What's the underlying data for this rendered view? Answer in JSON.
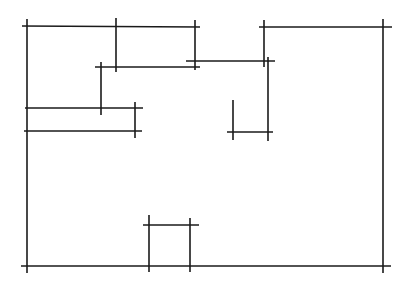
{
  "diagram": {
    "type": "floor-plan-sketch",
    "width": 407,
    "height": 295,
    "stroke_color": "#1a1a1a",
    "background": "#ffffff",
    "segments": [
      {
        "name": "outer-top-left-wall",
        "x1": 22,
        "y1": 26,
        "x2": 200,
        "y2": 27
      },
      {
        "name": "outer-left-wall",
        "x1": 27,
        "y1": 19,
        "x2": 27,
        "y2": 273
      },
      {
        "name": "outer-top-right-wall",
        "x1": 259,
        "y1": 27,
        "x2": 392,
        "y2": 27
      },
      {
        "name": "outer-right-wall",
        "x1": 383,
        "y1": 19,
        "x2": 383,
        "y2": 273
      },
      {
        "name": "outer-bottom-wall",
        "x1": 21,
        "y1": 266,
        "x2": 391,
        "y2": 266
      },
      {
        "name": "inner-vertical-a",
        "x1": 116,
        "y1": 18,
        "x2": 116,
        "y2": 72
      },
      {
        "name": "inner-vertical-b",
        "x1": 195,
        "y1": 20,
        "x2": 195,
        "y2": 70
      },
      {
        "name": "inner-horizontal-c",
        "x1": 95,
        "y1": 67,
        "x2": 200,
        "y2": 67
      },
      {
        "name": "inner-horizontal-d",
        "x1": 186,
        "y1": 61,
        "x2": 275,
        "y2": 61
      },
      {
        "name": "inner-vertical-e",
        "x1": 264,
        "y1": 20,
        "x2": 264,
        "y2": 67
      },
      {
        "name": "inner-vertical-f",
        "x1": 268,
        "y1": 57,
        "x2": 268,
        "y2": 141
      },
      {
        "name": "inner-vertical-g",
        "x1": 233,
        "y1": 100,
        "x2": 233,
        "y2": 140
      },
      {
        "name": "inner-horizontal-h",
        "x1": 227,
        "y1": 132,
        "x2": 273,
        "y2": 132
      },
      {
        "name": "inner-vertical-i",
        "x1": 101,
        "y1": 62,
        "x2": 101,
        "y2": 115
      },
      {
        "name": "inner-horizontal-j",
        "x1": 25,
        "y1": 108,
        "x2": 143,
        "y2": 108
      },
      {
        "name": "inner-horizontal-k",
        "x1": 24,
        "y1": 131,
        "x2": 142,
        "y2": 131
      },
      {
        "name": "inner-vertical-l",
        "x1": 135,
        "y1": 102,
        "x2": 135,
        "y2": 138
      },
      {
        "name": "door-left-jamb",
        "x1": 149,
        "y1": 215,
        "x2": 149,
        "y2": 272
      },
      {
        "name": "door-right-jamb",
        "x1": 190,
        "y1": 218,
        "x2": 190,
        "y2": 272
      },
      {
        "name": "door-header",
        "x1": 143,
        "y1": 225,
        "x2": 199,
        "y2": 225
      }
    ]
  }
}
